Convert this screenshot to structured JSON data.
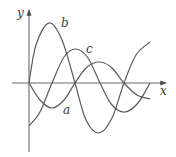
{
  "chart_data": {
    "type": "line",
    "title": "",
    "xlabel": "x",
    "ylabel": "y",
    "grid": false,
    "legend": "inline curve labels",
    "origin_px": [
      29,
      83
    ],
    "series": [
      {
        "name": "a",
        "label_pos_px": [
          63,
          114
        ],
        "points_px": [
          [
            29,
            83
          ],
          [
            40,
            100
          ],
          [
            52,
            108
          ],
          [
            64,
            100
          ],
          [
            75,
            83
          ],
          [
            87,
            67
          ],
          [
            100,
            62
          ],
          [
            112,
            68
          ],
          [
            124,
            83
          ],
          [
            137,
            95
          ],
          [
            150,
            99
          ]
        ]
      },
      {
        "name": "b",
        "label_pos_px": [
          61,
          27
        ],
        "points_px": [
          [
            29,
            83
          ],
          [
            36,
            45
          ],
          [
            49,
            23
          ],
          [
            62,
            40
          ],
          [
            75,
            83
          ],
          [
            86,
            120
          ],
          [
            99,
            133
          ],
          [
            112,
            118
          ],
          [
            124,
            83
          ],
          [
            136,
            55
          ],
          [
            150,
            42
          ]
        ]
      },
      {
        "name": "c",
        "label_pos_px": [
          86,
          53
        ],
        "points_px": [
          [
            29,
            126
          ],
          [
            40,
            112
          ],
          [
            52,
            83
          ],
          [
            64,
            57
          ],
          [
            76,
            49
          ],
          [
            88,
            58
          ],
          [
            100,
            83
          ],
          [
            112,
            105
          ],
          [
            125,
            112
          ],
          [
            138,
            103
          ],
          [
            150,
            83
          ]
        ]
      }
    ]
  },
  "axes": {
    "x_label": "x",
    "y_label": "y"
  },
  "labels": {
    "a": "a",
    "b": "b",
    "c": "c"
  }
}
